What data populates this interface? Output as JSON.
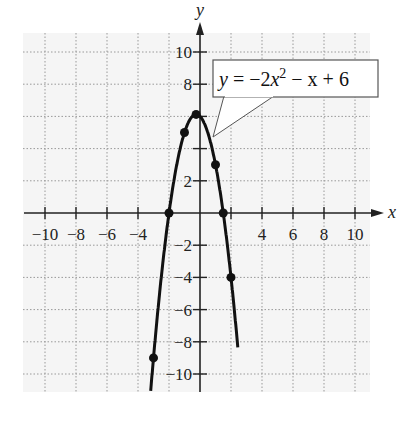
{
  "chart_data": {
    "type": "line",
    "title": "",
    "xlabel": "x",
    "ylabel": "y",
    "xlim": [
      -11.5,
      11
    ],
    "ylim": [
      -11.5,
      11.5
    ],
    "grid": true,
    "grid_style": "dotted",
    "x_ticks": [
      -10,
      -8,
      -6,
      -4,
      -2,
      2,
      4,
      6,
      8,
      10
    ],
    "x_tick_labels": [
      "−10",
      "−8",
      "−6",
      "−4",
      "4",
      "6",
      "8",
      "10"
    ],
    "x_tick_label_values": [
      -10,
      -8,
      -6,
      -4,
      4,
      6,
      8,
      10
    ],
    "y_ticks": [
      -10,
      -8,
      -6,
      -4,
      -2,
      2,
      4,
      6,
      8,
      10
    ],
    "y_tick_labels": [
      "10",
      "8",
      "2",
      "−2",
      "−4",
      "−6",
      "−8",
      "−10"
    ],
    "y_tick_label_values": [
      10,
      8,
      2,
      -2,
      -4,
      -6,
      -8,
      -10
    ],
    "series": [
      {
        "name": "y = −2x² − x + 6",
        "function": "-2*x^2 - x + 6",
        "color": "#111111",
        "points": [
          {
            "x": -3,
            "y": -9
          },
          {
            "x": -2,
            "y": 0
          },
          {
            "x": -1,
            "y": 5
          },
          {
            "x": -0.25,
            "y": 6.125
          },
          {
            "x": 1,
            "y": 3
          },
          {
            "x": 1.5,
            "y": 0
          },
          {
            "x": 2,
            "y": -4
          }
        ]
      }
    ],
    "annotations": [
      {
        "text_prefix": "y = −2x",
        "superscript": "2",
        "text_suffix": " − x + 6",
        "points_to": {
          "x": 0.8,
          "y": 4.6
        }
      }
    ]
  },
  "labels": {
    "x_axis": "x",
    "y_axis": "y",
    "equation_prefix": "y = −2x",
    "equation_sup": "2",
    "equation_suffix": " − x + 6"
  }
}
